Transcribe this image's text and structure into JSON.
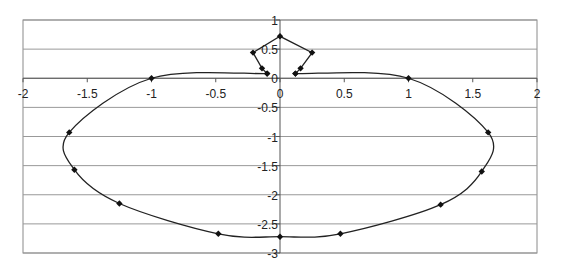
{
  "chart_data": {
    "type": "scatter",
    "title": "",
    "xlabel": "",
    "ylabel": "",
    "xlim": [
      -2,
      2
    ],
    "ylim": [
      -3,
      1
    ],
    "x_ticks": [
      -2,
      -1.5,
      -1,
      -0.5,
      0,
      0.5,
      1,
      1.5,
      2
    ],
    "x_tick_labels": [
      "-2",
      "-1.5",
      "-1",
      "-0.5",
      "0",
      "0.5",
      "1",
      "1.5",
      "2"
    ],
    "y_ticks": [
      1,
      0.5,
      0,
      -0.5,
      -1,
      -1.5,
      -2,
      -2.5,
      -3
    ],
    "y_tick_labels": [
      "1",
      "0.5",
      "0",
      "-0.5",
      "-1",
      "-1.5",
      "-2",
      "-2.5",
      "-3"
    ],
    "grid": {
      "horizontal": true,
      "vertical": false
    },
    "legend": null,
    "series": [
      {
        "name": "top-loop",
        "smooth": false,
        "markers": true,
        "points": [
          {
            "x": 0.12,
            "y": 0.08
          },
          {
            "x": 0.16,
            "y": 0.17
          },
          {
            "x": 0.25,
            "y": 0.44
          },
          {
            "x": 0.0,
            "y": 0.72
          },
          {
            "x": -0.21,
            "y": 0.44
          },
          {
            "x": -0.14,
            "y": 0.17
          },
          {
            "x": -0.1,
            "y": 0.08
          }
        ]
      },
      {
        "name": "outer-curve",
        "smooth": true,
        "markers": true,
        "points": [
          {
            "x": -0.1,
            "y": 0.08
          },
          {
            "x": -1.0,
            "y": 0.0
          },
          {
            "x": -1.64,
            "y": -0.93
          },
          {
            "x": -1.6,
            "y": -1.57
          },
          {
            "x": -1.25,
            "y": -2.15
          },
          {
            "x": -0.48,
            "y": -2.67
          },
          {
            "x": 0.0,
            "y": -2.72
          },
          {
            "x": 0.47,
            "y": -2.67
          },
          {
            "x": 1.25,
            "y": -2.17
          },
          {
            "x": 1.57,
            "y": -1.6
          },
          {
            "x": 1.62,
            "y": -0.93
          },
          {
            "x": 1.0,
            "y": 0.0
          },
          {
            "x": 0.12,
            "y": 0.08
          }
        ]
      }
    ],
    "colors": {
      "line": "#222222",
      "marker": "#111111",
      "grid": "#999999",
      "axis": "#555555"
    }
  }
}
